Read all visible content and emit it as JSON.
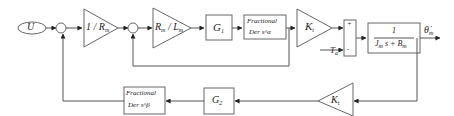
{
  "diagram": {
    "type": "block-diagram",
    "input": {
      "label": "U"
    },
    "sum_junctions": [
      {
        "id": "sum1",
        "signs": [
          "+",
          "-"
        ]
      },
      {
        "id": "sum2",
        "signs": [
          "+",
          "-"
        ]
      },
      {
        "id": "sum3",
        "signs": [
          "+",
          "-"
        ]
      }
    ],
    "forward_path": [
      {
        "id": "gain-inv-rm",
        "kind": "gain",
        "label": "1 / R",
        "sub": "m"
      },
      {
        "id": "gain-rm-lm",
        "kind": "gain",
        "label_a": "R",
        "sub_a": "m",
        "sep": " / ",
        "label_b": "L",
        "sub_b": "m"
      },
      {
        "id": "g1",
        "kind": "block",
        "label": "G",
        "sub": "1"
      },
      {
        "id": "frac-alpha",
        "kind": "block",
        "line1": "Fractional",
        "line2": "Der s^α"
      },
      {
        "id": "kt-forward",
        "kind": "gain",
        "label": "K",
        "sub": "t"
      },
      {
        "id": "plant",
        "kind": "transfer",
        "numerator": "1",
        "denominator": "J s + B",
        "den_sub_j": "m",
        "den_sub_b": "m"
      }
    ],
    "disturbance": {
      "label": "T",
      "sub": "a"
    },
    "output": {
      "label": "θ̇",
      "sub": "m"
    },
    "feedback_path": [
      {
        "id": "kt-feedback",
        "kind": "gain",
        "label": "K",
        "sub": "t"
      },
      {
        "id": "g2",
        "kind": "block",
        "label": "G",
        "sub": "2"
      },
      {
        "id": "frac-beta",
        "kind": "block",
        "line1": "Fractional",
        "line2": "Der s^β"
      }
    ],
    "signs": {
      "plus": "+",
      "minus": "-"
    }
  }
}
